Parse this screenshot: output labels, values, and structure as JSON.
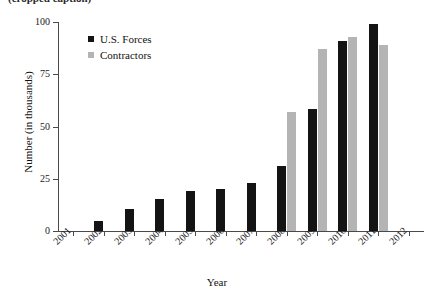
{
  "caption_remnant": "(cropped caption)",
  "chart_data": {
    "type": "bar",
    "title": "",
    "xlabel": "Year",
    "ylabel": "Number (in thousands)",
    "categories": [
      "2001",
      "2002",
      "2003",
      "2004",
      "2005",
      "2006",
      "2007",
      "2008",
      "2009",
      "2010",
      "2011",
      "2012"
    ],
    "series": [
      {
        "name": "U.S. Forces",
        "color": "#141414",
        "values": [
          0,
          5,
          10.5,
          15.5,
          19,
          20,
          23,
          31,
          58.5,
          91,
          99,
          0
        ]
      },
      {
        "name": "Contractors",
        "color": "#b4b4b4",
        "values": [
          0,
          0,
          0,
          0,
          0,
          0,
          0,
          57,
          87,
          93,
          89,
          0
        ]
      }
    ],
    "ylim": [
      0,
      100
    ],
    "yticks": [
      0,
      25,
      50,
      75,
      100
    ],
    "ytick_labels": [
      "0",
      "25",
      "50",
      "75",
      "100"
    ],
    "grid": false,
    "legend_position": "upper-left-inside",
    "xtick_rotation": -45
  },
  "legend": {
    "items": [
      {
        "label": "U.S. Forces",
        "swatch": "black-square-swatch"
      },
      {
        "label": "Contractors",
        "swatch": "gray-square-swatch"
      }
    ]
  }
}
